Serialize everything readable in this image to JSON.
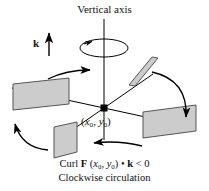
{
  "figure": {
    "title": "Vertical axis",
    "vector_label": "k",
    "point_label_open": "(",
    "point_label_x": "x",
    "point_label_x_sub": "0",
    "point_label_sep": ", ",
    "point_label_y": "y",
    "point_label_y_sub": "0",
    "point_label_close": ")",
    "caption_line1_prefix": "Curl ",
    "caption_line1_field": "F",
    "caption_line1_args_open": " (",
    "caption_line1_arg1": "x",
    "caption_line1_arg1_sub": "0",
    "caption_line1_args_sep": ", ",
    "caption_line1_arg2": "y",
    "caption_line1_arg2_sub": "0",
    "caption_line1_args_close": ")",
    "caption_line1_dot": " • ",
    "caption_line1_k": "k",
    "caption_line1_ineq": " < 0",
    "caption_line2": "Clockwise circulation",
    "colors": {
      "paddle_fill": "#cccccc",
      "paddle_stroke": "#555555",
      "line": "#000000",
      "text": "#111111",
      "background": "#ffffff"
    },
    "elements": {
      "vertical_axis": "vertical-axis-line",
      "rotation_ellipse": "clockwise-rotation-ellipse",
      "origin_marker": "origin-point-marker",
      "horizontal_axis_left": "horizontal-axis-left",
      "horizontal_axis_right": "horizontal-axis-right",
      "depth_axis": "depth-axis",
      "paddles": [
        "paddle-left",
        "paddle-top-right",
        "paddle-bottom-right",
        "paddle-bottom-left"
      ],
      "flow_arrows": [
        "flow-arrow-top-right",
        "flow-arrow-right-down",
        "flow-arrow-bottom-left",
        "flow-arrow-left-up"
      ]
    }
  }
}
